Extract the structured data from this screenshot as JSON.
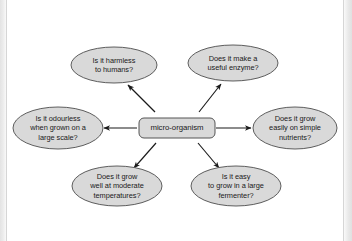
{
  "diagram": {
    "type": "spider-map",
    "center": {
      "id": "center",
      "shape": "rounded-rectangle",
      "label": "micro-organism",
      "lines": [
        "micro-organism"
      ],
      "cx": 177,
      "cy": 128,
      "width": 76,
      "height": 20
    },
    "branches": [
      {
        "id": "harmless-to-humans",
        "shape": "ellipse",
        "lines": [
          "Is it harmless",
          "to humans?"
        ],
        "cx": 114,
        "cy": 65,
        "rx": 43,
        "ry": 18,
        "arrow": {
          "x1": 155,
          "y1": 112,
          "x2": 128,
          "y2": 85
        }
      },
      {
        "id": "useful-enzyme",
        "shape": "ellipse",
        "lines": [
          "Does it make a",
          "useful enzyme?"
        ],
        "cx": 233,
        "cy": 63,
        "rx": 45,
        "ry": 18,
        "arrow": {
          "x1": 199,
          "y1": 112,
          "x2": 221,
          "y2": 84
        }
      },
      {
        "id": "odourless-large-scale",
        "shape": "ellipse",
        "lines": [
          "Is it odourless",
          "when grown on a",
          "large scale?"
        ],
        "cx": 58,
        "cy": 128,
        "rx": 45,
        "ry": 21,
        "arrow": {
          "x1": 137,
          "y1": 128,
          "x2": 104,
          "y2": 128
        }
      },
      {
        "id": "grow-simple-nutrients",
        "shape": "ellipse",
        "lines": [
          "Does it grow",
          "easily on simple",
          "nutrients?"
        ],
        "cx": 295,
        "cy": 128,
        "rx": 42,
        "ry": 21,
        "arrow": {
          "x1": 216,
          "y1": 128,
          "x2": 251,
          "y2": 128
        }
      },
      {
        "id": "grow-moderate-temperatures",
        "shape": "ellipse",
        "lines": [
          "Does it grow",
          "well at moderate",
          "temperatures?"
        ],
        "cx": 117,
        "cy": 186,
        "rx": 45,
        "ry": 20,
        "arrow": {
          "x1": 156,
          "y1": 143,
          "x2": 134,
          "y2": 168
        }
      },
      {
        "id": "easy-grow-large-fermenter",
        "shape": "ellipse",
        "lines": [
          "Is it easy",
          "to grow in a large",
          "fermenter?"
        ],
        "cx": 236,
        "cy": 186,
        "rx": 45,
        "ry": 20,
        "arrow": {
          "x1": 198,
          "y1": 143,
          "x2": 219,
          "y2": 168
        }
      }
    ],
    "style": {
      "node_fill": "#d9d9d9",
      "node_stroke": "#555555",
      "arrow_color": "#1a1a1a",
      "text_color": "#1a1a1a",
      "background": "#ffffff",
      "edge_band": "#e3e3e3"
    }
  }
}
